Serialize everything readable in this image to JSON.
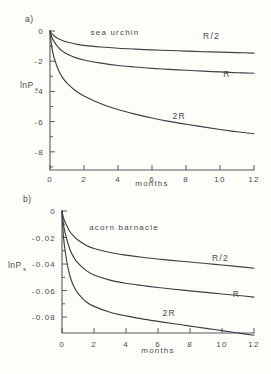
{
  "figure": {
    "background_color": "#fdfdfa",
    "ink_color": "#3f3f41",
    "axis_color": "#59595a"
  },
  "panels": [
    {
      "id": "a",
      "label": "a)",
      "species": "sea urchin",
      "ylabel_main": "lnP",
      "ylabel_sub": "s",
      "xlabel": "months"
    },
    {
      "id": "b",
      "label": "b)",
      "species": "acorn barnacle",
      "ylabel_main": "lnP",
      "ylabel_sub": "s",
      "xlabel": "months"
    }
  ],
  "chart_data": [
    {
      "type": "line",
      "panel": "a",
      "title": "sea urchin",
      "xlabel": "months",
      "ylabel": "lnP_s",
      "xlim": [
        0,
        12
      ],
      "ylim": [
        -9.2,
        0
      ],
      "grid": false,
      "legend": "inline-curve-labels",
      "xticks": [
        0,
        2,
        4,
        6,
        8,
        10,
        12
      ],
      "xtick_labels": [
        "0",
        "2",
        "4",
        "6",
        "8",
        "10",
        "12"
      ],
      "xminor_ticks": [
        1,
        3,
        5,
        7,
        9,
        11
      ],
      "yticks": [
        0,
        -2,
        -4,
        -6,
        -8
      ],
      "ytick_labels": [
        "0",
        "-2",
        "-4",
        "-6",
        "-8"
      ],
      "yminor_ticks": [
        -1,
        -3,
        -5,
        -7,
        -9
      ],
      "x": [
        0,
        0.1,
        0.25,
        0.5,
        0.75,
        1,
        1.5,
        2,
        3,
        4,
        5,
        6,
        7,
        8,
        9,
        10,
        11,
        12
      ],
      "series": [
        {
          "name": "R/2",
          "label": "R/2",
          "label_x": 9.5,
          "label_y": -0.55,
          "values": [
            0,
            -0.18,
            -0.33,
            -0.52,
            -0.64,
            -0.73,
            -0.86,
            -0.95,
            -1.06,
            -1.14,
            -1.2,
            -1.25,
            -1.29,
            -1.33,
            -1.37,
            -1.4,
            -1.43,
            -1.46
          ]
        },
        {
          "name": "R",
          "label": "R",
          "label_x": 10.4,
          "label_y": -3.05,
          "values": [
            0,
            -0.4,
            -0.72,
            -1.1,
            -1.35,
            -1.52,
            -1.76,
            -1.92,
            -2.13,
            -2.28,
            -2.38,
            -2.47,
            -2.54,
            -2.6,
            -2.66,
            -2.71,
            -2.76,
            -2.8
          ]
        },
        {
          "name": "2R",
          "label": "2R",
          "label_x": 7.6,
          "label_y": -5.85,
          "values": [
            0,
            -1.05,
            -1.8,
            -2.6,
            -3.1,
            -3.45,
            -3.95,
            -4.3,
            -4.82,
            -5.2,
            -5.5,
            -5.76,
            -5.98,
            -6.17,
            -6.35,
            -6.52,
            -6.67,
            -6.8
          ]
        }
      ]
    },
    {
      "type": "line",
      "panel": "b",
      "title": "acorn barnacle",
      "xlabel": "months",
      "ylabel": "lnP_s",
      "xlim": [
        0,
        12
      ],
      "ylim": [
        -0.092,
        0
      ],
      "grid": false,
      "legend": "inline-curve-labels",
      "xticks": [
        0,
        2,
        4,
        6,
        8,
        10,
        12
      ],
      "xtick_labels": [
        "0",
        "2",
        "4",
        "6",
        "8",
        "10",
        "12"
      ],
      "xminor_ticks": [
        1,
        3,
        5,
        7,
        9,
        11
      ],
      "yticks": [
        0,
        -0.02,
        -0.04,
        -0.06,
        -0.08
      ],
      "ytick_labels": [
        "0",
        "-0.02",
        "-0.04",
        "-0.06",
        "-0.08"
      ],
      "yminor_ticks": [
        -0.01,
        -0.03,
        -0.05,
        -0.07
      ],
      "x": [
        0,
        0.1,
        0.25,
        0.5,
        0.75,
        1,
        1.5,
        2,
        3,
        4,
        5,
        6,
        7,
        8,
        9,
        10,
        11,
        12
      ],
      "series": [
        {
          "name": "R/2",
          "label": "R/2",
          "label_x": 9.9,
          "label_y": -0.0375,
          "values": [
            0,
            -0.0055,
            -0.0099,
            -0.0156,
            -0.0192,
            -0.0219,
            -0.0258,
            -0.0283,
            -0.0313,
            -0.0333,
            -0.0349,
            -0.0362,
            -0.0374,
            -0.0385,
            -0.0396,
            -0.0407,
            -0.0419,
            -0.0432
          ]
        },
        {
          "name": "R",
          "label": "R",
          "label_x": 10.9,
          "label_y": -0.0645,
          "values": [
            0,
            -0.0108,
            -0.0192,
            -0.0292,
            -0.0352,
            -0.0393,
            -0.0448,
            -0.0482,
            -0.0521,
            -0.0545,
            -0.0562,
            -0.0577,
            -0.059,
            -0.0602,
            -0.0614,
            -0.0626,
            -0.0637,
            -0.0649
          ]
        },
        {
          "name": "2R",
          "label": "2R",
          "label_x": 6.7,
          "label_y": -0.0793,
          "values": [
            0,
            -0.0205,
            -0.0345,
            -0.0492,
            -0.0572,
            -0.0622,
            -0.0684,
            -0.0719,
            -0.0763,
            -0.0791,
            -0.0813,
            -0.0832,
            -0.085,
            -0.0868,
            -0.0885,
            -0.0902,
            -0.092,
            -0.0937
          ]
        }
      ]
    }
  ]
}
